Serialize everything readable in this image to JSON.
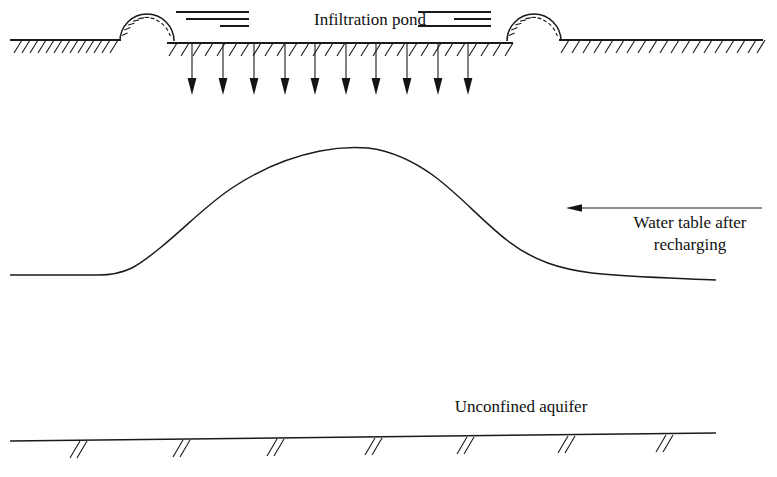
{
  "figure": {
    "type": "cross-section-diagram",
    "background_color": "#ffffff",
    "line_color": "#1a1a1a"
  },
  "labels": {
    "pond": "Infiltration pond",
    "water_table_line1": "Water table after",
    "water_table_line2": "recharging",
    "aquifer": "Unconfined aquifer"
  },
  "diagram_data": {
    "ground_surface": {
      "left_segment": {
        "x1": 10,
        "x2": 120,
        "y": 40
      },
      "pond_floor": {
        "x1": 168,
        "x2": 512,
        "y": 43
      },
      "right_segment": {
        "x1": 560,
        "x2": 762,
        "y": 40
      },
      "hatch_count_left": 13,
      "hatch_count_pond": 28,
      "hatch_count_right": 19
    },
    "berms": [
      {
        "name": "left-berm",
        "center_x": 147,
        "base_y": 41,
        "radius": 27,
        "ray_count": 13
      },
      {
        "name": "right-berm",
        "center_x": 534,
        "base_y": 41,
        "radius": 27,
        "ray_count": 13
      }
    ],
    "water_symbols": [
      {
        "name": "left-water-lines",
        "lines": [
          {
            "x1": 176,
            "x2": 249,
            "y": 12
          },
          {
            "x1": 186,
            "x2": 249,
            "y": 19
          },
          {
            "x1": 220,
            "x2": 249,
            "y": 26
          }
        ]
      },
      {
        "name": "right-water-lines",
        "lines": [
          {
            "x1": 418,
            "x2": 491,
            "y": 12
          },
          {
            "x1": 454,
            "x2": 491,
            "y": 19
          },
          {
            "x1": 418,
            "x2": 491,
            "y": 26
          }
        ]
      }
    ],
    "infiltration_arrows": {
      "count": 10,
      "x_positions": [
        192,
        223,
        254,
        285,
        315,
        346,
        376,
        407,
        438,
        468
      ],
      "y_top": 44,
      "y_tip": 95
    },
    "water_table_curve": {
      "description": "mounded water table after recharge",
      "points": [
        {
          "x": 10,
          "y": 275
        },
        {
          "x": 100,
          "y": 275
        },
        {
          "x": 160,
          "y": 248
        },
        {
          "x": 230,
          "y": 190
        },
        {
          "x": 300,
          "y": 157
        },
        {
          "x": 365,
          "y": 148
        },
        {
          "x": 430,
          "y": 160
        },
        {
          "x": 500,
          "y": 208
        },
        {
          "x": 570,
          "y": 255
        },
        {
          "x": 640,
          "y": 271
        },
        {
          "x": 715,
          "y": 278
        }
      ],
      "peak": {
        "x": 365,
        "y": 148
      },
      "baseline_y": 275
    },
    "callout_arrow": {
      "name": "water-table-callout-arrow",
      "x_tail": 762,
      "x_head": 567,
      "y": 208,
      "direction": "left"
    },
    "aquifer_base": {
      "x1": 10,
      "x2": 716,
      "y1": 440,
      "y2": 432,
      "slash_marks": 7,
      "slash_x_positions": [
        75,
        178,
        272,
        370,
        462,
        563,
        661
      ]
    },
    "text_positions": {
      "pond_label": {
        "x": 370,
        "y": 20
      },
      "aquifer_label": {
        "x": 520,
        "y": 408
      },
      "water_table_label": {
        "x": 688,
        "y": 228
      }
    }
  }
}
